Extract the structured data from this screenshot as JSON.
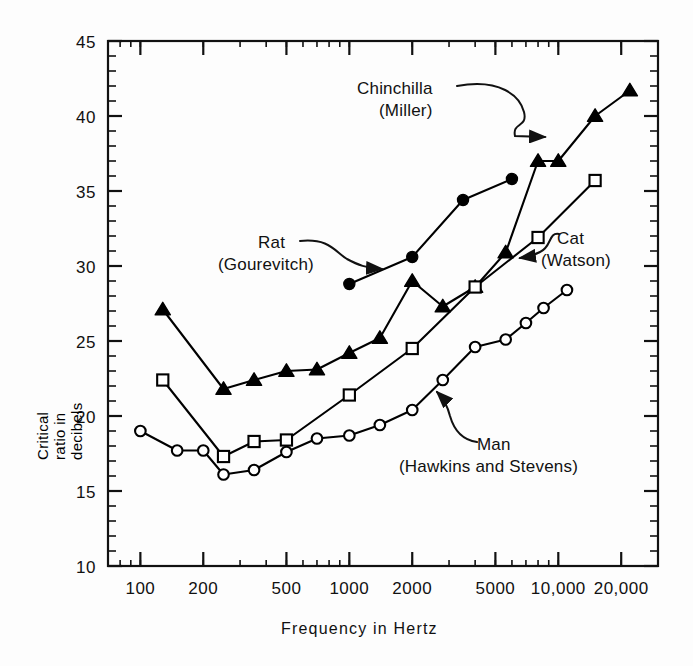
{
  "figure": {
    "xlabel": "Frequency in Hertz",
    "ylabel": "Critical ratio in decibels"
  },
  "annotations": {
    "chinchilla": {
      "line1": "Chinchilla",
      "line2": "(Miller)"
    },
    "rat": {
      "line1": "Rat",
      "line2": "(Gourevitch)"
    },
    "cat": {
      "line1": "Cat",
      "line2": "(Watson)"
    },
    "man": {
      "line1": "Man",
      "line2": "(Hawkins and Stevens)"
    }
  },
  "axes": {
    "x_ticks": [
      "100",
      "200",
      "500",
      "1000",
      "2000",
      "5000",
      "10,000",
      "20,000"
    ],
    "y_ticks": [
      "10",
      "15",
      "20",
      "25",
      "30",
      "35",
      "40",
      "45"
    ]
  },
  "chart_data": {
    "type": "line",
    "title": "",
    "xlabel": "Frequency in Hertz",
    "ylabel": "Critical ratio in decibels",
    "xscale": "log",
    "xlim": [
      70,
      30000
    ],
    "ylim": [
      10,
      45
    ],
    "x_tick_values": [
      100,
      200,
      500,
      1000,
      2000,
      5000,
      10000,
      20000
    ],
    "x_tick_labels": [
      "100",
      "200",
      "500",
      "1000",
      "2000",
      "5000",
      "10,000",
      "20,000"
    ],
    "y_tick_values": [
      10,
      15,
      20,
      25,
      30,
      35,
      40,
      45
    ],
    "y_minor_tick_step": 1,
    "grid": false,
    "legend": "annotated-callouts",
    "series": [
      {
        "name": "Chinchilla (Miller)",
        "marker": "filled-triangle",
        "color": "#000000",
        "points": [
          [
            128,
            27.1
          ],
          [
            250,
            21.8
          ],
          [
            350,
            22.4
          ],
          [
            500,
            23.0
          ],
          [
            700,
            23.1
          ],
          [
            1000,
            24.2
          ],
          [
            1400,
            25.2
          ],
          [
            2000,
            29.0
          ],
          [
            2800,
            27.3
          ],
          [
            4000,
            28.6
          ],
          [
            5600,
            30.9
          ],
          [
            8000,
            37.0
          ],
          [
            10000,
            37.0
          ],
          [
            15000,
            40.0
          ],
          [
            22000,
            41.7
          ]
        ]
      },
      {
        "name": "Rat (Gourevitch)",
        "marker": "filled-circle",
        "color": "#000000",
        "points": [
          [
            1000,
            28.8
          ],
          [
            2000,
            30.6
          ],
          [
            3500,
            34.4
          ],
          [
            6000,
            35.8
          ]
        ]
      },
      {
        "name": "Cat (Watson)",
        "marker": "open-square",
        "color": "#000000",
        "points": [
          [
            128,
            22.4
          ],
          [
            250,
            17.3
          ],
          [
            350,
            18.3
          ],
          [
            500,
            18.4
          ],
          [
            1000,
            21.4
          ],
          [
            2000,
            24.5
          ],
          [
            4000,
            28.6
          ],
          [
            8000,
            31.9
          ],
          [
            15000,
            35.7
          ]
        ]
      },
      {
        "name": "Man (Hawkins and Stevens)",
        "marker": "open-circle",
        "color": "#000000",
        "points": [
          [
            100,
            19.0
          ],
          [
            150,
            17.7
          ],
          [
            200,
            17.7
          ],
          [
            250,
            16.1
          ],
          [
            350,
            16.4
          ],
          [
            500,
            17.6
          ],
          [
            700,
            18.5
          ],
          [
            1000,
            18.7
          ],
          [
            1400,
            19.4
          ],
          [
            2000,
            20.4
          ],
          [
            2800,
            22.4
          ],
          [
            4000,
            24.6
          ],
          [
            5600,
            25.1
          ],
          [
            7000,
            26.2
          ],
          [
            8500,
            27.2
          ],
          [
            11000,
            28.4
          ]
        ]
      }
    ]
  }
}
